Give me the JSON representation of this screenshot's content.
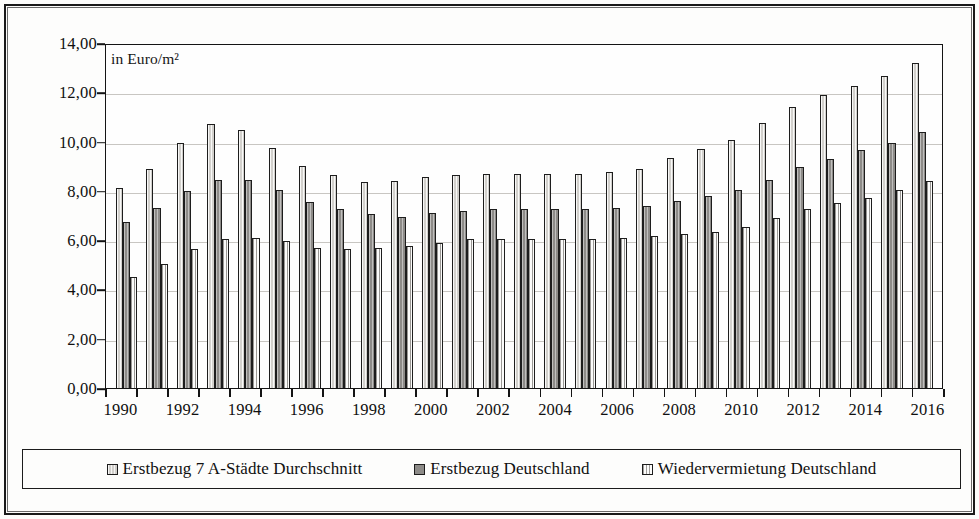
{
  "annotation": {
    "unit_label": "in Euro/m²"
  },
  "legend": {
    "items": [
      {
        "label": "Erstbezug 7 A-Städte Durchschnitt",
        "swatch": "s1"
      },
      {
        "label": "Erstbezug Deutschland",
        "swatch": "s2"
      },
      {
        "label": "Wiedervermietung Deutschland",
        "swatch": "s3"
      }
    ]
  },
  "chart_data": {
    "type": "bar",
    "title": "",
    "subtitle": "",
    "xlabel": "",
    "ylabel": "in Euro/m²",
    "ylim": [
      0,
      14
    ],
    "ytick_labels": [
      "14,00",
      "12,00",
      "10,00",
      "8,00",
      "6,00",
      "4,00",
      "2,00",
      "0,00"
    ],
    "ytick_values": [
      14,
      12,
      10,
      8,
      6,
      4,
      2,
      0
    ],
    "grid": true,
    "grid_axis": "y",
    "legend_position": "bottom",
    "categories": [
      "1990",
      "1991",
      "1992",
      "1993",
      "1994",
      "1995",
      "1996",
      "1997",
      "1998",
      "1999",
      "2000",
      "2001",
      "2002",
      "2003",
      "2004",
      "2005",
      "2006",
      "2007",
      "2008",
      "2009",
      "2010",
      "2011",
      "2012",
      "2013",
      "2014",
      "2015",
      "2016"
    ],
    "xtick_labels_shown": [
      "1990",
      "1992",
      "1994",
      "1996",
      "1998",
      "2000",
      "2002",
      "2004",
      "2006",
      "2008",
      "2010",
      "2012",
      "2014",
      "2016"
    ],
    "series": [
      {
        "name": "Erstbezug 7 A-Städte Durchschnitt",
        "fill": "s1",
        "values": [
          8.1,
          8.9,
          9.95,
          10.7,
          10.45,
          9.75,
          9.0,
          8.65,
          8.35,
          8.4,
          8.55,
          8.65,
          8.7,
          8.7,
          8.7,
          8.7,
          8.75,
          8.9,
          9.35,
          9.7,
          10.05,
          10.75,
          11.4,
          11.9,
          12.25,
          12.65,
          13.2
        ]
      },
      {
        "name": "Erstbezug Deutschland",
        "fill": "s2",
        "values": [
          6.75,
          7.3,
          8.0,
          8.45,
          8.45,
          8.05,
          7.55,
          7.25,
          7.05,
          6.95,
          7.1,
          7.2,
          7.25,
          7.25,
          7.25,
          7.25,
          7.3,
          7.4,
          7.6,
          7.8,
          8.05,
          8.45,
          8.95,
          9.3,
          9.65,
          9.95,
          10.4
        ]
      },
      {
        "name": "Wiedervermietung Deutschland",
        "fill": "s3",
        "values": [
          4.5,
          5.05,
          5.65,
          6.05,
          6.1,
          5.95,
          5.7,
          5.65,
          5.7,
          5.75,
          5.9,
          6.05,
          6.05,
          6.05,
          6.05,
          6.05,
          6.1,
          6.15,
          6.25,
          6.35,
          6.55,
          6.9,
          7.25,
          7.5,
          7.7,
          8.05,
          8.4
        ]
      }
    ]
  }
}
